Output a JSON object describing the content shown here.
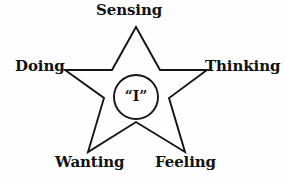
{
  "diagram": {
    "type": "star-pentagram",
    "background_color": "#fefefe",
    "stroke_color": "#141414",
    "center": {
      "label": "“I”",
      "shape": "circle"
    },
    "points": [
      {
        "id": "sensing",
        "label": "Sensing",
        "position": "top"
      },
      {
        "id": "thinking",
        "label": "Thinking",
        "position": "right"
      },
      {
        "id": "feeling",
        "label": "Feeling",
        "position": "bottom-right"
      },
      {
        "id": "wanting",
        "label": "Wanting",
        "position": "bottom-left"
      },
      {
        "id": "doing",
        "label": "Doing",
        "position": "left"
      }
    ],
    "geometry": {
      "star_outer_points": "136,27 160,70 207,70 169,98 185,152 136,122 88,152 104,98 65,70 112,70",
      "circle_cx": 136,
      "circle_cy": 97,
      "circle_r": 22
    }
  }
}
